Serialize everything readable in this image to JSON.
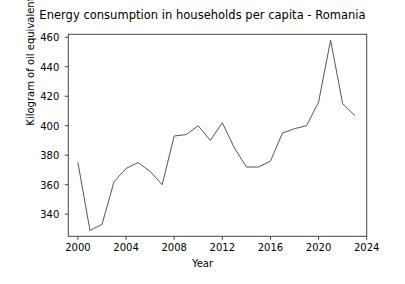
{
  "chart_data": {
    "type": "line",
    "title": "Energy consumption in households per capita - Romania",
    "xlabel": "Year",
    "ylabel": "Kilogram of oil equivalent",
    "xlim": [
      1999.2,
      2024.0
    ],
    "ylim": [
      325.0,
      462.0
    ],
    "grid": false,
    "legend": null,
    "xticks": [
      2000,
      2004,
      2008,
      2012,
      2016,
      2020,
      2024
    ],
    "xtick_labels": [
      "2000",
      "2004",
      "2008",
      "2012",
      "2016",
      "2020",
      "2024"
    ],
    "yticks": [
      340,
      360,
      380,
      400,
      420,
      440,
      460
    ],
    "ytick_labels": [
      "340",
      "360",
      "380",
      "400",
      "420",
      "440",
      "460"
    ],
    "line_color": "#555555",
    "line_width": 1.0,
    "x": [
      2000,
      2001,
      2002,
      2003,
      2004,
      2005,
      2006,
      2007,
      2008,
      2009,
      2010,
      2011,
      2012,
      2013,
      2014,
      2015,
      2016,
      2017,
      2018,
      2019,
      2020,
      2021,
      2022,
      2023
    ],
    "values": [
      375,
      329,
      333,
      362,
      371,
      375,
      369,
      360,
      393,
      394,
      400,
      390,
      402,
      385,
      372,
      372,
      376,
      395,
      398,
      400,
      416,
      458,
      415,
      407
    ],
    "series": [
      {
        "name": "Romania",
        "values": [
          375,
          329,
          333,
          362,
          371,
          375,
          369,
          360,
          393,
          394,
          400,
          390,
          402,
          385,
          372,
          372,
          376,
          395,
          398,
          400,
          416,
          458,
          415,
          407
        ]
      }
    ]
  }
}
